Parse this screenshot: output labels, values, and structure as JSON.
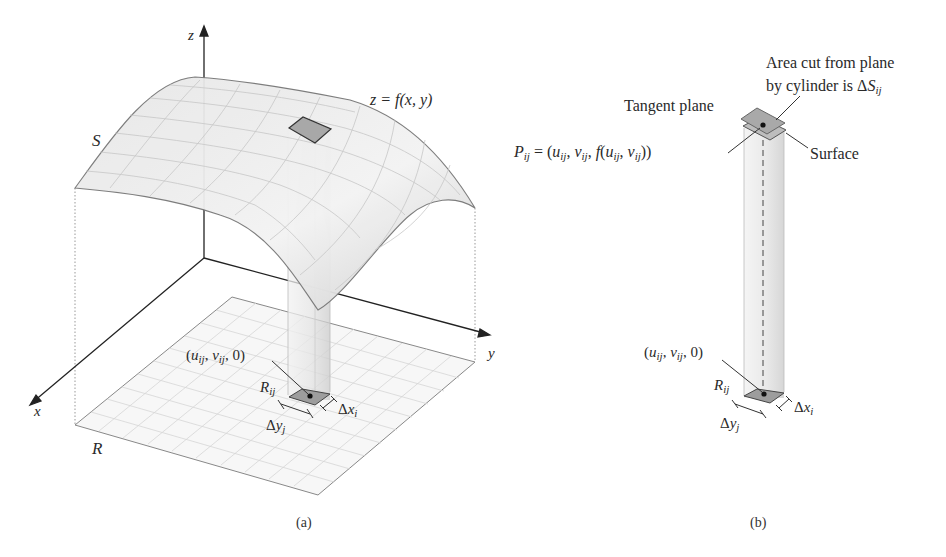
{
  "figure_a": {
    "caption": "(a)",
    "axis_labels": {
      "x": "x",
      "y": "y",
      "z": "z"
    },
    "surface_label": "S",
    "region_label": "R",
    "function_label": "z = f(x, y)",
    "point_label": "(u_ij, v_ij, 0)",
    "subregion_label": "R_ij",
    "delta_x_label": "Δx_i",
    "delta_y_label": "Δy_j"
  },
  "figure_b": {
    "caption": "(b)",
    "area_note_line1": "Area cut from plane",
    "area_note_line2": "by cylinder is ΔS_ij",
    "tangent_plane_label": "Tangent plane",
    "surface_label": "Surface",
    "point_label": "P_ij = (u_ij, v_ij, f(u_ij, v_ij))",
    "base_point_label": "(u_ij, v_ij, 0)",
    "subregion_label": "R_ij",
    "delta_x_label": "Δx_i",
    "delta_y_label": "Δy_j"
  },
  "colors": {
    "surface_fill": "#ececec",
    "grid": "#c9c9c9",
    "axis": "#222222",
    "patch": "#9a9a9a"
  }
}
